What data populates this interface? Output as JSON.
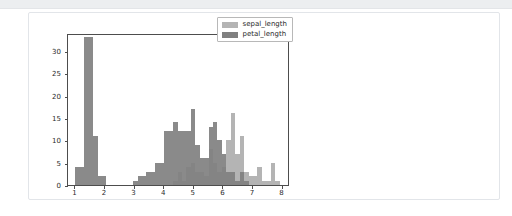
{
  "page": {
    "background": "#ffffff",
    "toolbar_color": "#eceef0",
    "card_border": "#e2e5e9"
  },
  "chart_data": {
    "type": "bar",
    "subtype": "histogram-overlay",
    "title": "",
    "xlabel": "",
    "ylabel": "",
    "xlim": [
      0.75,
      8.25
    ],
    "ylim": [
      0,
      34
    ],
    "grid": false,
    "legend_position": "upper right",
    "xticks": [
      1,
      2,
      3,
      4,
      5,
      6,
      7,
      8
    ],
    "yticks": [
      0,
      5,
      10,
      15,
      20,
      25,
      30
    ],
    "bin_width": 0.15,
    "series": [
      {
        "name": "sepal_length",
        "color": "#b4b4b4",
        "bins": [
          {
            "x": 4.3,
            "value": 1
          },
          {
            "x": 4.45,
            "value": 3
          },
          {
            "x": 4.6,
            "value": 1
          },
          {
            "x": 4.75,
            "value": 4
          },
          {
            "x": 4.9,
            "value": 5
          },
          {
            "x": 5.05,
            "value": 3
          },
          {
            "x": 5.2,
            "value": 3
          },
          {
            "x": 5.35,
            "value": 2
          },
          {
            "x": 5.5,
            "value": 8
          },
          {
            "x": 5.65,
            "value": 5
          },
          {
            "x": 5.8,
            "value": 3
          },
          {
            "x": 5.95,
            "value": 4
          },
          {
            "x": 6.1,
            "value": 10
          },
          {
            "x": 6.25,
            "value": 16
          },
          {
            "x": 6.4,
            "value": 7
          },
          {
            "x": 6.55,
            "value": 11
          },
          {
            "x": 6.7,
            "value": 3
          },
          {
            "x": 6.85,
            "value": 2
          },
          {
            "x": 7.0,
            "value": 2
          },
          {
            "x": 7.15,
            "value": 4
          },
          {
            "x": 7.3,
            "value": 1
          },
          {
            "x": 7.45,
            "value": 1
          },
          {
            "x": 7.6,
            "value": 5
          },
          {
            "x": 7.75,
            "value": 1
          }
        ]
      },
      {
        "name": "petal_length",
        "color": "#808080",
        "bins": [
          {
            "x": 1.0,
            "value": 4
          },
          {
            "x": 1.15,
            "value": 4
          },
          {
            "x": 1.3,
            "value": 33
          },
          {
            "x": 1.45,
            "value": 33
          },
          {
            "x": 1.6,
            "value": 11
          },
          {
            "x": 1.75,
            "value": 2
          },
          {
            "x": 1.9,
            "value": 2
          },
          {
            "x": 2.95,
            "value": 1
          },
          {
            "x": 3.1,
            "value": 2
          },
          {
            "x": 3.25,
            "value": 2
          },
          {
            "x": 3.4,
            "value": 3
          },
          {
            "x": 3.55,
            "value": 3
          },
          {
            "x": 3.7,
            "value": 5
          },
          {
            "x": 3.85,
            "value": 5
          },
          {
            "x": 4.0,
            "value": 12
          },
          {
            "x": 4.15,
            "value": 12
          },
          {
            "x": 4.3,
            "value": 14
          },
          {
            "x": 4.45,
            "value": 12
          },
          {
            "x": 4.6,
            "value": 12
          },
          {
            "x": 4.75,
            "value": 12
          },
          {
            "x": 4.9,
            "value": 17
          },
          {
            "x": 5.05,
            "value": 9
          },
          {
            "x": 5.2,
            "value": 6
          },
          {
            "x": 5.35,
            "value": 6
          },
          {
            "x": 5.5,
            "value": 13
          },
          {
            "x": 5.65,
            "value": 14
          },
          {
            "x": 5.8,
            "value": 10
          },
          {
            "x": 5.95,
            "value": 7
          },
          {
            "x": 6.1,
            "value": 3
          },
          {
            "x": 6.25,
            "value": 3
          },
          {
            "x": 6.4,
            "value": 1
          },
          {
            "x": 6.55,
            "value": 3
          },
          {
            "x": 6.7,
            "value": 1
          }
        ]
      }
    ],
    "legend": [
      {
        "label": "sepal_length",
        "color": "#b4b4b4"
      },
      {
        "label": "petal_length",
        "color": "#808080"
      }
    ]
  }
}
